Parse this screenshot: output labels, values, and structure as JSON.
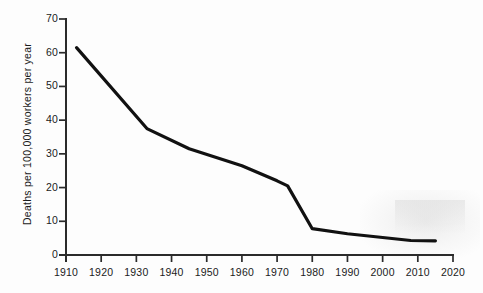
{
  "chart_data": {
    "type": "line",
    "title": "",
    "xlabel": "",
    "ylabel": "Deaths per 100,000 workers per year",
    "xlim": [
      1910,
      2020
    ],
    "ylim": [
      0,
      70
    ],
    "xticks": [
      1910,
      1920,
      1930,
      1940,
      1950,
      1960,
      1970,
      1980,
      1990,
      2000,
      2010,
      2020
    ],
    "yticks": [
      0,
      10,
      20,
      30,
      40,
      50,
      60,
      70
    ],
    "grid": false,
    "legend": "none",
    "line_color": "#111111",
    "x": [
      1913,
      1933,
      1945,
      1960,
      1970,
      1973,
      1980,
      1990,
      2000,
      2008,
      2015
    ],
    "values": [
      61.5,
      37.5,
      31.5,
      26.5,
      22.0,
      20.5,
      7.8,
      6.3,
      5.2,
      4.3,
      4.2
    ],
    "series": [
      {
        "name": "Worker deaths",
        "points": [
          {
            "x": 1913,
            "y": 61.5
          },
          {
            "x": 1933,
            "y": 37.5
          },
          {
            "x": 1945,
            "y": 31.5
          },
          {
            "x": 1960,
            "y": 26.5
          },
          {
            "x": 1970,
            "y": 22.0
          },
          {
            "x": 1973,
            "y": 20.5
          },
          {
            "x": 1980,
            "y": 7.8
          },
          {
            "x": 1990,
            "y": 6.3
          },
          {
            "x": 2000,
            "y": 5.2
          },
          {
            "x": 2008,
            "y": 4.3
          },
          {
            "x": 2015,
            "y": 4.2
          }
        ]
      }
    ]
  },
  "axis": {
    "y_title": "Deaths per 100,000 workers per year",
    "x_tick_labels": [
      "1910",
      "1920",
      "1930",
      "1940",
      "1950",
      "1960",
      "1970",
      "1980",
      "1990",
      "2000",
      "2010",
      "2020"
    ],
    "y_tick_labels": [
      "0",
      "10",
      "20",
      "30",
      "40",
      "50",
      "60",
      "70"
    ]
  },
  "colors": {
    "background": "#fdfdfd",
    "axis": "#2b2b2b",
    "line": "#111111",
    "text": "#1b1b1b"
  }
}
